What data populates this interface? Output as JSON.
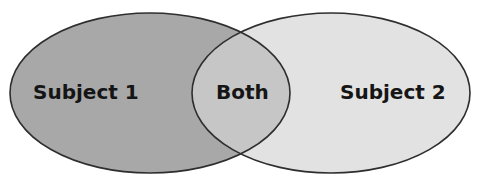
{
  "diagram": {
    "type": "venn",
    "sets": [
      {
        "id": "subject1",
        "label": "Subject 1",
        "fill": "#a8a8a8"
      },
      {
        "id": "subject2",
        "label": "Subject 2",
        "fill": "#e2e2e2"
      }
    ],
    "intersection": {
      "label": "Both",
      "fill": "#c6c6c6"
    },
    "stroke": "#2e2e2e"
  }
}
